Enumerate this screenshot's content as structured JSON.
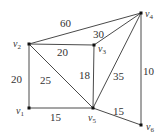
{
  "diagram": {
    "type": "weighted-undirected-graph",
    "nodes": [
      {
        "id": "v1",
        "name": "v",
        "sub": "1",
        "x": 29,
        "y": 108,
        "lx": 16,
        "ly": 114
      },
      {
        "id": "v2",
        "name": "v",
        "sub": "2",
        "x": 29,
        "y": 44,
        "lx": 13,
        "ly": 47
      },
      {
        "id": "v3",
        "name": "v",
        "sub": "3",
        "x": 94,
        "y": 45,
        "lx": 98,
        "ly": 52
      },
      {
        "id": "v4",
        "name": "v",
        "sub": "4",
        "x": 141,
        "y": 13,
        "lx": 145,
        "ly": 17
      },
      {
        "id": "v5",
        "name": "v",
        "sub": "5",
        "x": 93,
        "y": 108,
        "lx": 88,
        "ly": 121
      },
      {
        "id": "v6",
        "name": "v",
        "sub": "6",
        "x": 141,
        "y": 125,
        "lx": 146,
        "ly": 130
      }
    ],
    "edges": [
      {
        "from": "v2",
        "to": "v4",
        "weight": "60",
        "lx": 60,
        "ly": 27
      },
      {
        "from": "v2",
        "to": "v3",
        "weight": "20",
        "lx": 57,
        "ly": 56
      },
      {
        "from": "v3",
        "to": "v4",
        "weight": "30",
        "lx": 93,
        "ly": 38
      },
      {
        "from": "v2",
        "to": "v1",
        "weight": "20",
        "lx": 11,
        "ly": 83
      },
      {
        "from": "v2",
        "to": "v5",
        "weight": "25",
        "lx": 40,
        "ly": 84
      },
      {
        "from": "v3",
        "to": "v5",
        "weight": "18",
        "lx": 79,
        "ly": 79
      },
      {
        "from": "v4",
        "to": "v5",
        "weight": "35",
        "lx": 113,
        "ly": 80
      },
      {
        "from": "v4",
        "to": "v6",
        "weight": "10",
        "lx": 143,
        "ly": 75
      },
      {
        "from": "v1",
        "to": "v5",
        "weight": "15",
        "lx": 50,
        "ly": 121
      },
      {
        "from": "v5",
        "to": "v6",
        "weight": "15",
        "lx": 113,
        "ly": 115
      }
    ]
  }
}
